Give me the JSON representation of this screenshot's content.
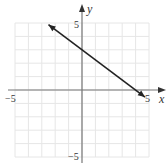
{
  "chart_data": {
    "type": "line",
    "title": "",
    "xlabel": "x",
    "ylabel": "y",
    "xlim": [
      -5,
      5
    ],
    "ylim": [
      -5,
      5
    ],
    "grid": true,
    "tick_labels": {
      "x_min": "−5",
      "x_max": "5",
      "y_min": "−5",
      "y_max": "5"
    },
    "series": [
      {
        "name": "line",
        "equation": "y = -0.75x + 3",
        "x": [
          -2.5,
          0,
          4,
          4.7
        ],
        "y": [
          4.875,
          3,
          0,
          -0.525
        ],
        "arrows_both_ends": true
      }
    ],
    "colors": {
      "grid": "#e6e6e6",
      "axis": "#777777",
      "line": "#222222"
    }
  }
}
